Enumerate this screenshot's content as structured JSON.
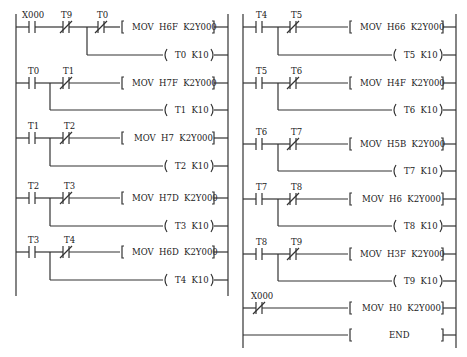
{
  "diagram": {
    "type": "ladder-logic",
    "colors": {
      "line": "#333333",
      "background": "#ffffff"
    },
    "columns": [
      {
        "id": "left",
        "rungs": [
          {
            "contacts": [
              {
                "name": "X000",
                "type": "NO"
              },
              {
                "name": "T9",
                "type": "NC"
              },
              {
                "name": "T0",
                "type": "NC"
              }
            ],
            "instruction": "MOV  H6F  K2Y000",
            "branch_coil": "T0  K10"
          },
          {
            "contacts": [
              {
                "name": "T0",
                "type": "NO"
              },
              {
                "name": "T1",
                "type": "NC"
              }
            ],
            "instruction": "MOV  H7F  K2Y000",
            "branch_coil": "T1  K10"
          },
          {
            "contacts": [
              {
                "name": "T1",
                "type": "NO"
              },
              {
                "name": "T2",
                "type": "NC"
              }
            ],
            "instruction": "MOV  H7  K2Y000",
            "branch_coil": "T2  K10"
          },
          {
            "contacts": [
              {
                "name": "T2",
                "type": "NO"
              },
              {
                "name": "T3",
                "type": "NC"
              }
            ],
            "instruction": "MOV  H7D  K2Y000",
            "branch_coil": "T3  K10"
          },
          {
            "contacts": [
              {
                "name": "T3",
                "type": "NO"
              },
              {
                "name": "T4",
                "type": "NC"
              }
            ],
            "instruction": "MOV  H6D  K2Y000",
            "branch_coil": "T4  K10"
          }
        ]
      },
      {
        "id": "right",
        "rungs": [
          {
            "contacts": [
              {
                "name": "T4",
                "type": "NO"
              },
              {
                "name": "T5",
                "type": "NC"
              }
            ],
            "instruction": "MOV  H66  K2Y000",
            "branch_coil": "T5  K10"
          },
          {
            "contacts": [
              {
                "name": "T5",
                "type": "NO"
              },
              {
                "name": "T6",
                "type": "NC"
              }
            ],
            "instruction": "MOV  H4F  K2Y000",
            "branch_coil": "T6  K10"
          },
          {
            "contacts": [
              {
                "name": "T6",
                "type": "NO"
              },
              {
                "name": "T7",
                "type": "NC"
              }
            ],
            "instruction": "MOV  H5B  K2Y000",
            "branch_coil": "T7  K10"
          },
          {
            "contacts": [
              {
                "name": "T7",
                "type": "NO"
              },
              {
                "name": "T8",
                "type": "NC"
              }
            ],
            "instruction": "MOV  H6  K2Y000",
            "branch_coil": "T8  K10"
          },
          {
            "contacts": [
              {
                "name": "T8",
                "type": "NO"
              },
              {
                "name": "T9",
                "type": "NC"
              }
            ],
            "instruction": "MOV  H3F  K2Y000",
            "branch_coil": "T9  K10"
          },
          {
            "contacts": [
              {
                "name": "X000",
                "type": "NC"
              }
            ],
            "instruction": "MOV  H0  K2Y000"
          },
          {
            "contacts": [],
            "instruction": "END"
          }
        ]
      }
    ]
  }
}
